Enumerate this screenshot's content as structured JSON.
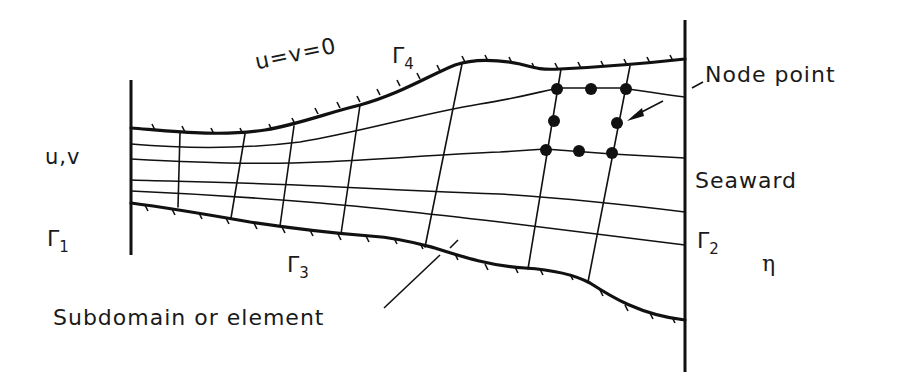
{
  "diagram": {
    "boundary_labels": {
      "top_condition": "u=v=0",
      "gamma1": {
        "symbol": "Γ",
        "sub": "1"
      },
      "gamma2": {
        "symbol": "Γ",
        "sub": "2"
      },
      "gamma3": {
        "symbol": "Γ",
        "sub": "3"
      },
      "gamma4": {
        "symbol": "Γ",
        "sub": "4"
      }
    },
    "left_boundary_vars": "u,v",
    "right_boundary_var": "η",
    "annotations": {
      "node_point": "Node point",
      "seaward": "Seaward",
      "subdomain": "Subdomain or element"
    },
    "colors": {
      "ink": "#111111",
      "background": "#ffffff"
    },
    "element_nodes": 8
  }
}
